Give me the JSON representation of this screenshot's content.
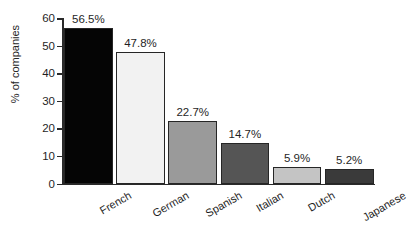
{
  "chart_data": {
    "type": "bar",
    "title": "",
    "xlabel": "",
    "ylabel": "% of companies",
    "categories": [
      "French",
      "German",
      "Spanish",
      "Italian",
      "Dutch",
      "Japanese"
    ],
    "values": [
      56.5,
      47.8,
      22.7,
      14.7,
      5.9,
      5.2
    ],
    "value_labels": [
      "56.5%",
      "47.8%",
      "22.7%",
      "14.7%",
      "5.9%",
      "5.2%"
    ],
    "bar_colors": [
      "#050505",
      "#f2f2f2",
      "#9a9a9a",
      "#555555",
      "#c4c4c4",
      "#3a3a3a"
    ],
    "bar_edge_color": "#262626",
    "ylim": [
      0,
      60
    ],
    "yticks": [
      0,
      10,
      20,
      30,
      40,
      50,
      60
    ],
    "ytick_labels": [
      "0",
      "10",
      "20",
      "30",
      "40",
      "50",
      "60"
    ],
    "grid": false,
    "legend": null,
    "legend_position": "none",
    "axis_color": "#2a2a2a",
    "background": "#ffffff",
    "xtick_label_rotation": -30
  },
  "title_fragment": "",
  "axis": {
    "y_label": "% of companies"
  }
}
